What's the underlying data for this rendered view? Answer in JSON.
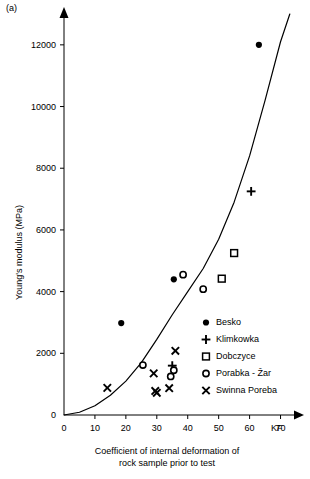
{
  "panel": {
    "label": "(a)"
  },
  "chart_data": {
    "type": "scatter",
    "title": "",
    "xlabel": "Coefficient of internal deformation of rock sample prior to test",
    "xlabel_line1": "Coefficient of internal deformation of",
    "xlabel_line2": "rock sample prior to test",
    "ylabel": "Young's modulus (MPa)",
    "x_unit": "KF",
    "xlim": [
      0,
      75
    ],
    "ylim": [
      0,
      13000
    ],
    "xticks": [
      0,
      10,
      20,
      30,
      40,
      50,
      60,
      70
    ],
    "xticklabels": [
      "0",
      "10",
      "20",
      "30",
      "40",
      "50",
      "60",
      "70"
    ],
    "yticks": [
      0,
      2000,
      4000,
      6000,
      8000,
      10000,
      12000
    ],
    "yticklabels": [
      "0",
      "2000",
      "4000",
      "6000",
      "8000",
      "10000",
      "12000"
    ],
    "grid": false,
    "legend_position": "inside-lower-right",
    "axis_style": "arrow-ended-L-axes",
    "series": [
      {
        "name": "Besko",
        "marker": "filled-circle",
        "points": [
          {
            "x": 18.5,
            "y": 2980
          },
          {
            "x": 35.5,
            "y": 4400
          },
          {
            "x": 63.0,
            "y": 12000
          }
        ]
      },
      {
        "name": "Klimkowka",
        "marker": "plus",
        "points": [
          {
            "x": 35.0,
            "y": 1600
          },
          {
            "x": 60.5,
            "y": 7250
          }
        ]
      },
      {
        "name": "Dobczyce",
        "marker": "open-square",
        "points": [
          {
            "x": 51.0,
            "y": 4420
          },
          {
            "x": 55.0,
            "y": 5250
          }
        ]
      },
      {
        "name": "Porabka - Žar",
        "marker": "open-circle",
        "points": [
          {
            "x": 25.5,
            "y": 1620
          },
          {
            "x": 34.5,
            "y": 1250
          },
          {
            "x": 35.5,
            "y": 1450
          },
          {
            "x": 38.5,
            "y": 4550
          },
          {
            "x": 45.0,
            "y": 4080
          }
        ]
      },
      {
        "name": "Swinna Poreba",
        "marker": "cross",
        "points": [
          {
            "x": 14.0,
            "y": 880
          },
          {
            "x": 29.0,
            "y": 1350
          },
          {
            "x": 29.5,
            "y": 780
          },
          {
            "x": 30.0,
            "y": 720
          },
          {
            "x": 34.0,
            "y": 870
          },
          {
            "x": 36.0,
            "y": 2080
          }
        ]
      }
    ],
    "fit_curve": {
      "name": "trend-curve",
      "description": "monotonic increasing power-law style curve from origin",
      "points": [
        {
          "x": 0,
          "y": 0
        },
        {
          "x": 5,
          "y": 90
        },
        {
          "x": 10,
          "y": 300
        },
        {
          "x": 15,
          "y": 640
        },
        {
          "x": 20,
          "y": 1100
        },
        {
          "x": 25,
          "y": 1700
        },
        {
          "x": 30,
          "y": 2450
        },
        {
          "x": 35,
          "y": 3250
        },
        {
          "x": 40,
          "y": 4000
        },
        {
          "x": 45,
          "y": 4750
        },
        {
          "x": 50,
          "y": 5700
        },
        {
          "x": 55,
          "y": 6900
        },
        {
          "x": 60,
          "y": 8400
        },
        {
          "x": 65,
          "y": 10200
        },
        {
          "x": 70,
          "y": 12100
        },
        {
          "x": 73,
          "y": 13000
        }
      ]
    },
    "legend": [
      {
        "label": "Besko",
        "marker": "filled-circle"
      },
      {
        "label": "Klimkowka",
        "marker": "plus"
      },
      {
        "label": "Dobczyce",
        "marker": "open-square"
      },
      {
        "label": "Porabka - Žar",
        "marker": "open-circle"
      },
      {
        "label": "Swinna Poreba",
        "marker": "cross"
      }
    ]
  }
}
